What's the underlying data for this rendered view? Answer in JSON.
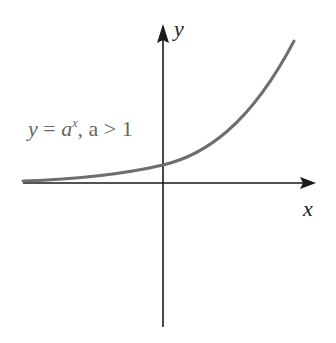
{
  "diagram": {
    "axes": {
      "x_label": "x",
      "y_label": "y"
    },
    "curve_label": {
      "lhs": "y",
      "eq": " = ",
      "base": "a",
      "exponent": "x",
      "condition": ", a > 1"
    },
    "colors": {
      "axis": "#1a1a1a",
      "curve": "#6e6e6e",
      "label": "#666666"
    }
  }
}
